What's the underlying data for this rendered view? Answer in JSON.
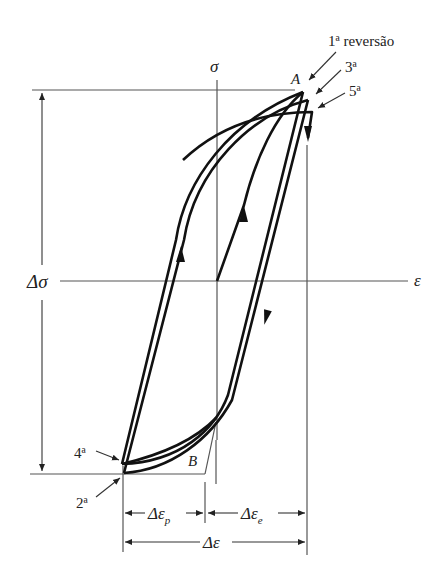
{
  "figure": {
    "type": "stress-strain hysteresis loop",
    "axes": {
      "y_label": "σ",
      "x_label": "ε"
    },
    "points": {
      "A": "A",
      "B": "B"
    },
    "reversal_labels": {
      "first": "1ª reversão",
      "third": "3ª",
      "fifth": "5ª",
      "second": "2ª",
      "fourth": "4ª"
    },
    "dimensions": {
      "stress_range": "Δσ",
      "plastic_strain": "Δε",
      "plastic_sub": "p",
      "elastic_strain": "Δε",
      "elastic_sub": "e",
      "total_strain": "Δε"
    },
    "colors": {
      "curve": "#111111",
      "guide": "#555555",
      "background": "#ffffff"
    }
  }
}
